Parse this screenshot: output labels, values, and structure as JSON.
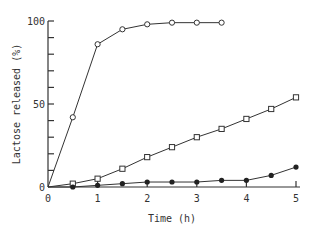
{
  "chart_data": {
    "type": "line",
    "title": "",
    "xlabel": "Time (h)",
    "ylabel": "Lactose released (%)",
    "xlim": [
      0,
      5
    ],
    "ylim": [
      0,
      100
    ],
    "x_ticks": [
      "0",
      "1",
      "2",
      "3",
      "4",
      "5"
    ],
    "y_ticks": [
      "0",
      "50",
      "100"
    ],
    "grid": false,
    "legend": "none",
    "series": [
      {
        "name": "open-circle",
        "marker": "open circle",
        "x": [
          0,
          0.5,
          1,
          1.5,
          2,
          2.5,
          3,
          3.5
        ],
        "values": [
          0,
          42,
          86,
          95,
          98,
          99,
          99,
          99
        ]
      },
      {
        "name": "open-square",
        "marker": "open square",
        "x": [
          0,
          0.5,
          1,
          1.5,
          2,
          2.5,
          3,
          3.5,
          4,
          4.5,
          5
        ],
        "values": [
          0,
          2,
          5,
          11,
          18,
          24,
          30,
          35,
          41,
          47,
          54
        ]
      },
      {
        "name": "filled-circle",
        "marker": "filled circle",
        "x": [
          0,
          0.5,
          1,
          1.5,
          2,
          2.5,
          3,
          3.5,
          4,
          4.5,
          5
        ],
        "values": [
          0,
          0,
          1,
          2,
          3,
          3,
          3,
          4,
          4,
          7,
          12
        ]
      }
    ]
  }
}
